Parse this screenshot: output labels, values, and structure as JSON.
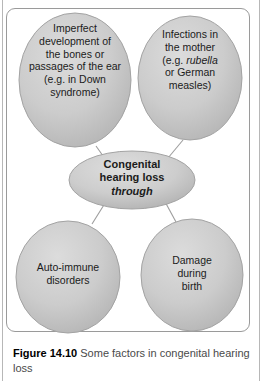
{
  "figure": {
    "caption_label": "Figure 14.10",
    "caption_text": "Some factors in congenital hearing loss",
    "frame_border_color": "#9a9a9a",
    "background_color": "#ffffff"
  },
  "diagram": {
    "type": "concept-map",
    "node_fill_color": "#c9c9c9",
    "node_edge_color": "#a0a0a0",
    "connector_color": "#9d9d9d",
    "text_color": "#1b1b1b",
    "central": {
      "id": "congenital-hearing-loss",
      "shape": "ellipse",
      "line1": "Congenital",
      "line2": "hearing loss",
      "line3": "through",
      "line3_style": "bold-italic"
    },
    "factors": [
      {
        "id": "imperfect-development",
        "shape": "ellipse",
        "position": "top-left",
        "lines": [
          "Imperfect",
          "development of",
          "the bones or",
          "passages of the ear",
          "(e.g. in Down",
          "syndrome)"
        ]
      },
      {
        "id": "infections-in-mother",
        "shape": "ellipse",
        "position": "top-right",
        "line_a": "Infections in",
        "line_b": "the mother",
        "line_c_pre": "(e.g. ",
        "line_c_italic": "rubella",
        "line_d": "or German",
        "line_e": "measles)"
      },
      {
        "id": "auto-immune-disorders",
        "shape": "ellipse",
        "position": "bottom-left",
        "lines": [
          "Auto-immune",
          "disorders"
        ]
      },
      {
        "id": "damage-during-birth",
        "shape": "ellipse",
        "position": "bottom-right",
        "lines": [
          "Damage",
          "during",
          "birth"
        ]
      }
    ],
    "connectors": [
      {
        "from": "imperfect-development",
        "to": "congenital-hearing-loss"
      },
      {
        "from": "infections-in-mother",
        "to": "congenital-hearing-loss"
      },
      {
        "from": "congenital-hearing-loss",
        "to": "auto-immune-disorders"
      },
      {
        "from": "congenital-hearing-loss",
        "to": "damage-during-birth"
      }
    ]
  }
}
